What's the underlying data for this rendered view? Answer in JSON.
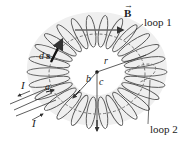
{
  "diagram": {
    "type": "toroid",
    "labels": {
      "field": "B",
      "loop1": "loop 1",
      "loop2": "loop 2",
      "ds_d": "d",
      "ds_s": "s",
      "current_top": "I",
      "current_bottom": "I",
      "a": "a",
      "b": "b",
      "c": "c",
      "r": "r"
    },
    "colors": {
      "coil": "#555555",
      "fill": "#eeeeee",
      "line": "#333333",
      "dash": "#666666"
    }
  }
}
